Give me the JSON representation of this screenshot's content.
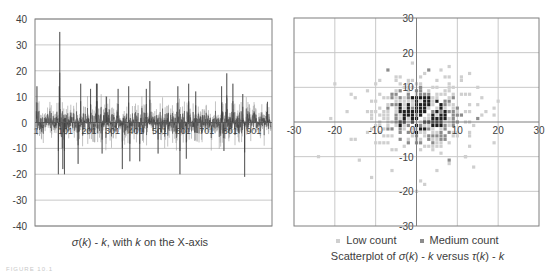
{
  "figure_label": "FIGURE 10.1",
  "colors": {
    "gridline": "#c8c8c8",
    "border": "#7f7f7f",
    "line_series": "#3a3a3a",
    "line_series_light": "#9a9a9a",
    "low_count": "#cfcfcf",
    "medium_count": "#8c8c8c",
    "high_count": "#202020",
    "text": "#404040"
  },
  "left_chart": {
    "caption_parts": {
      "sigma": "σ",
      "k1": "k",
      "mid": ") - ",
      "k2": "k",
      "tail": ", with ",
      "k3": "k",
      "end": " on the X-axis"
    },
    "caption": "σ(k) - k, with k on the X-axis"
  },
  "right_chart": {
    "legend": [
      {
        "label": "Low count",
        "color": "#cfcfcf"
      },
      {
        "label": "Medium count",
        "color": "#8c8c8c"
      }
    ],
    "caption": "Scatterplot of σ(k) - k versus τ(k) - k"
  },
  "chart_data": [
    {
      "type": "line",
      "title": "σ(k) - k, with k on the X-axis",
      "xlabel": "k",
      "ylabel": "σ(k) - k",
      "x_range": [
        1,
        1000
      ],
      "xticks": [
        "1",
        "101",
        "201",
        "301",
        "401",
        "501",
        "601",
        "701",
        "801",
        "901"
      ],
      "yticks": [
        40,
        30,
        20,
        10,
        0,
        -10,
        -20,
        -30,
        -40
      ],
      "ylim": [
        -40,
        40
      ],
      "grid": "horizontal",
      "noise_amplitude_typical": 8,
      "notable_points": [
        {
          "k": 5,
          "value": 14
        },
        {
          "k": 102,
          "value": 35
        },
        {
          "k": 100,
          "value": 14
        },
        {
          "k": 96,
          "value": -20
        },
        {
          "k": 122,
          "value": -20
        },
        {
          "k": 115,
          "value": -18
        },
        {
          "k": 191,
          "value": 15
        },
        {
          "k": 180,
          "value": -16
        },
        {
          "k": 258,
          "value": 15
        },
        {
          "k": 261,
          "value": 15
        },
        {
          "k": 233,
          "value": 13
        },
        {
          "k": 301,
          "value": 10
        },
        {
          "k": 282,
          "value": -12
        },
        {
          "k": 350,
          "value": 13
        },
        {
          "k": 395,
          "value": 14
        },
        {
          "k": 368,
          "value": -18
        },
        {
          "k": 400,
          "value": -15
        },
        {
          "k": 470,
          "value": 13
        },
        {
          "k": 485,
          "value": 16
        },
        {
          "k": 442,
          "value": -15
        },
        {
          "k": 520,
          "value": -12
        },
        {
          "k": 604,
          "value": 14
        },
        {
          "k": 650,
          "value": 15
        },
        {
          "k": 613,
          "value": -20
        },
        {
          "k": 680,
          "value": 12
        },
        {
          "k": 640,
          "value": -14
        },
        {
          "k": 790,
          "value": 14
        },
        {
          "k": 812,
          "value": 19
        },
        {
          "k": 838,
          "value": 15
        },
        {
          "k": 800,
          "value": -11
        },
        {
          "k": 888,
          "value": -21
        },
        {
          "k": 880,
          "value": 11
        },
        {
          "k": 985,
          "value": 8
        }
      ]
    },
    {
      "type": "scatter",
      "title": "Scatterplot of σ(k) - k versus τ(k) - k",
      "xlabel": "τ(k) - k",
      "ylabel": "σ(k) - k",
      "xlim": [
        -30,
        30
      ],
      "ylim": [
        -30,
        30
      ],
      "xticks": [
        -30,
        -20,
        -10,
        0,
        10,
        20,
        30
      ],
      "yticks": [
        30,
        20,
        10,
        -10,
        -20,
        -30
      ],
      "grid": "both",
      "series": [
        {
          "name": "Low count",
          "note": "sparse lattice points, spread roughly -22..20 in x, -20..17 in y"
        },
        {
          "name": "Medium count",
          "note": "dense core roughly -8..10 in x, -6..10 in y, with darkest points near origin; empty diagonal at σ(k)=τ(k)"
        }
      ],
      "outliers": [
        {
          "x": -21,
          "y": 1,
          "series": "Low count"
        },
        {
          "x": 19,
          "y": 4,
          "series": "Low count"
        },
        {
          "x": 13,
          "y": -3,
          "series": "Low count"
        },
        {
          "x": 8,
          "y": 16,
          "series": "Low count"
        },
        {
          "x": -7,
          "y": 15,
          "series": "Medium count"
        },
        {
          "x": 3,
          "y": 15,
          "series": "Medium count"
        },
        {
          "x": 8,
          "y": -11,
          "series": "Medium count"
        },
        {
          "x": 2,
          "y": -18,
          "series": "Low count"
        },
        {
          "x": 0,
          "y": -20,
          "series": "Low count"
        },
        {
          "x": -6,
          "y": -14,
          "series": "Low count"
        },
        {
          "x": -24,
          "y": -10,
          "series": "Low count"
        },
        {
          "x": 12,
          "y": -10,
          "series": "Low count"
        },
        {
          "x": 15,
          "y": 1,
          "series": "Medium count"
        }
      ]
    }
  ]
}
